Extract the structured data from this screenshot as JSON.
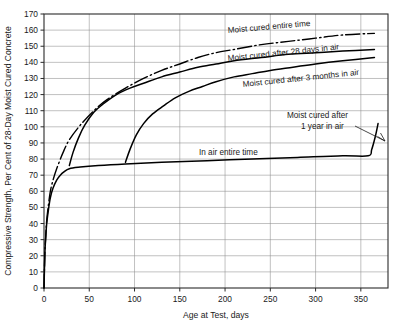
{
  "chart_data": {
    "type": "line",
    "title": "",
    "xlabel": "Age at Test, days",
    "ylabel": "Compressive Strength, Per Cent of 28-Day Moist Cured Concrete",
    "xlim": [
      0,
      380
    ],
    "ylim": [
      0,
      170
    ],
    "xticks": [
      0,
      50,
      100,
      150,
      200,
      250,
      300,
      350
    ],
    "yticks": [
      0,
      10,
      20,
      30,
      40,
      50,
      60,
      70,
      80,
      90,
      100,
      110,
      120,
      130,
      140,
      150,
      160,
      170
    ],
    "grid": true,
    "legend_position": "inline-annotations",
    "series": [
      {
        "name": "Moist cured entire time",
        "style": "dash-dot",
        "points": [
          [
            0,
            0
          ],
          [
            1,
            22
          ],
          [
            2,
            33
          ],
          [
            3,
            42
          ],
          [
            5,
            52
          ],
          [
            7,
            60
          ],
          [
            10,
            67
          ],
          [
            14,
            74
          ],
          [
            21,
            84
          ],
          [
            28,
            92
          ],
          [
            40,
            101
          ],
          [
            55,
            110
          ],
          [
            70,
            117
          ],
          [
            90,
            124
          ],
          [
            110,
            130
          ],
          [
            130,
            135
          ],
          [
            150,
            139
          ],
          [
            170,
            143
          ],
          [
            190,
            146
          ],
          [
            210,
            148
          ],
          [
            240,
            151
          ],
          [
            270,
            153
          ],
          [
            300,
            155
          ],
          [
            330,
            157
          ],
          [
            365,
            158
          ]
        ]
      },
      {
        "name": "Moist cured after 28 days in air",
        "style": "solid",
        "points": [
          [
            28,
            76
          ],
          [
            32,
            84
          ],
          [
            38,
            93
          ],
          [
            45,
            101
          ],
          [
            55,
            109
          ],
          [
            65,
            114
          ],
          [
            80,
            120
          ],
          [
            95,
            124
          ],
          [
            110,
            127
          ],
          [
            130,
            131
          ],
          [
            150,
            134
          ],
          [
            170,
            137
          ],
          [
            190,
            139
          ],
          [
            210,
            141
          ],
          [
            240,
            143
          ],
          [
            270,
            145
          ],
          [
            300,
            146
          ],
          [
            330,
            147
          ],
          [
            365,
            148
          ]
        ]
      },
      {
        "name": "Moist cured after 3 months in air",
        "style": "solid",
        "points": [
          [
            90,
            78
          ],
          [
            95,
            86
          ],
          [
            102,
            95
          ],
          [
            110,
            102
          ],
          [
            120,
            108
          ],
          [
            132,
            113
          ],
          [
            145,
            118
          ],
          [
            160,
            122
          ],
          [
            175,
            125
          ],
          [
            190,
            128
          ],
          [
            210,
            131
          ],
          [
            230,
            133
          ],
          [
            250,
            135
          ],
          [
            275,
            137
          ],
          [
            300,
            139
          ],
          [
            330,
            141
          ],
          [
            365,
            143
          ]
        ]
      },
      {
        "name": "In air entire time",
        "style": "solid",
        "points": [
          [
            0,
            0
          ],
          [
            1,
            22
          ],
          [
            2,
            32
          ],
          [
            3,
            40
          ],
          [
            5,
            49
          ],
          [
            7,
            56
          ],
          [
            10,
            62
          ],
          [
            14,
            67
          ],
          [
            18,
            70
          ],
          [
            22,
            72
          ],
          [
            28,
            74
          ],
          [
            40,
            75
          ],
          [
            60,
            76
          ],
          [
            90,
            77
          ],
          [
            130,
            78
          ],
          [
            180,
            79
          ],
          [
            230,
            80
          ],
          [
            280,
            81
          ],
          [
            330,
            82
          ],
          [
            358,
            82
          ],
          [
            362,
            86
          ],
          [
            366,
            94
          ],
          [
            369,
            102
          ]
        ]
      }
    ],
    "annotations": [
      {
        "name": "moist-cured-entire-time",
        "text": "Moist cured entire time"
      },
      {
        "name": "moist-cured-after-28-days",
        "text": "Moist cured after 28 days in air"
      },
      {
        "name": "moist-cured-after-3-months",
        "text": "Moist cured after 3 months in air"
      },
      {
        "name": "moist-cured-after-1-year-line1",
        "text": "Moist cured after"
      },
      {
        "name": "moist-cured-after-1-year-line2",
        "text": "1 year in air"
      },
      {
        "name": "in-air-entire-time",
        "text": "In air entire time"
      }
    ]
  }
}
